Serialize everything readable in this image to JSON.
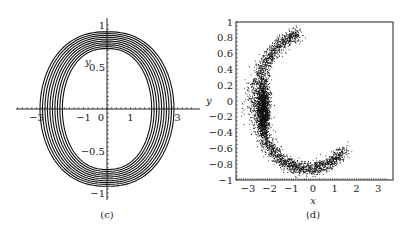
{
  "chart_data": [
    {
      "panel": "c",
      "caption": "(c)",
      "type": "line",
      "description": "Phase portrait: nested closed orbits (limit-cycle band) in the x-y plane",
      "xlabel": "",
      "ylabel": "y",
      "xlim": [
        -3.9,
        3.9
      ],
      "ylim": [
        -1.1,
        1.1
      ],
      "xticks": [
        -3,
        -1,
        0,
        1,
        3
      ],
      "yticks": [
        1,
        0.5,
        -0.5,
        -1
      ],
      "xtick_labels": [
        "−3",
        "−1",
        "0",
        "1",
        "3"
      ],
      "ytick_labels": [
        "1",
        "0.5",
        "−0.5",
        "−1"
      ],
      "grid": false,
      "orbits": {
        "count": 10,
        "x_amplitude_range": [
          1.9,
          2.85
        ],
        "y_amplitude_range": [
          0.72,
          0.92
        ]
      }
    },
    {
      "panel": "d",
      "caption": "(d)",
      "type": "scatter",
      "description": "Poincaré-type scatter forming a crescent; dense cluster near x≈-2.3, y≈-0.1",
      "xlabel": "x",
      "ylabel": "y",
      "xlim": [
        -3.5,
        3.5
      ],
      "ylim": [
        -1,
        1
      ],
      "xticks": [
        -3,
        -2,
        -1,
        0,
        1,
        2,
        3
      ],
      "yticks": [
        1,
        0.8,
        0.6,
        0.4,
        0.2,
        0,
        -0.2,
        -0.4,
        -0.6,
        -0.8,
        -1
      ],
      "xtick_labels": [
        "−3",
        "−2",
        "−1",
        "0",
        "1",
        "2",
        "3"
      ],
      "ytick_labels": [
        "1",
        "0.8",
        "0.6",
        "0.4",
        "0.2",
        "0",
        "−0.2",
        "−0.4",
        "−0.6",
        "−0.8",
        "−1"
      ],
      "grid": false,
      "crescent": {
        "top_end": [
          0.3,
          0.85
        ],
        "left_extreme": [
          -2.6,
          0.0
        ],
        "dense_center": [
          -2.3,
          -0.1
        ],
        "bottom": [
          -0.2,
          -0.85
        ],
        "right_end": [
          2.0,
          -0.38
        ]
      }
    }
  ]
}
